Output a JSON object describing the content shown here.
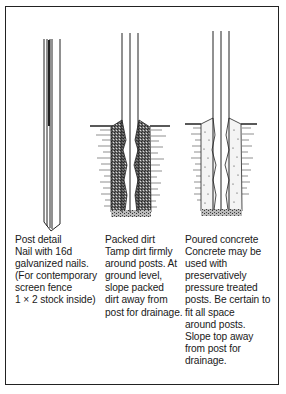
{
  "panels": [
    {
      "id": "post-detail",
      "lines": [
        "Post detail",
        "Nail with 16d",
        "galvanized nails.",
        "(For contemporary",
        "screen fence",
        "1 × 2 stock inside)"
      ]
    },
    {
      "id": "packed-dirt",
      "lines": [
        "Packed dirt",
        "Tamp dirt firmly",
        "around posts. At",
        "ground level,",
        "slope packed",
        "dirt away from",
        "post for drainage."
      ]
    },
    {
      "id": "poured-concrete",
      "lines": [
        "Poured concrete",
        "Concrete may be",
        "used with",
        "preservatively",
        "pressure treated",
        "posts. Be certain to",
        "fit all space",
        "around posts.",
        "Slope top away",
        "from post for",
        "drainage."
      ]
    }
  ],
  "colors": {
    "ink": "#1a1a1a",
    "background": "#ffffff",
    "dirt": "#555555",
    "concrete": "#f4f4f4"
  }
}
